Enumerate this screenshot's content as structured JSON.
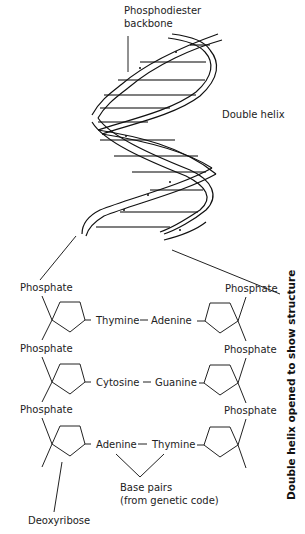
{
  "diagram": {
    "title_vertical": "Double helix opened to show structure",
    "labels": {
      "backbone_line1": "Phosphodiester",
      "backbone_line2": "backbone",
      "double_helix": "Double helix",
      "base_pairs_line1": "Base pairs",
      "base_pairs_line2": "(from genetic code)",
      "deoxyribose": "Deoxyribose"
    },
    "left_phosphates": [
      "Phosphate",
      "Phosphate",
      "Phosphate"
    ],
    "right_phosphates": [
      "Phosphate",
      "Phosphate",
      "Phosphate"
    ],
    "base_pairs": [
      {
        "left": "Thymine",
        "right": "Adenine"
      },
      {
        "left": "Cytosine",
        "right": "Guanine"
      },
      {
        "left": "Adenine",
        "right": "Thymine"
      }
    ],
    "colors": {
      "ink": "#111111",
      "background": "#ffffff"
    }
  }
}
